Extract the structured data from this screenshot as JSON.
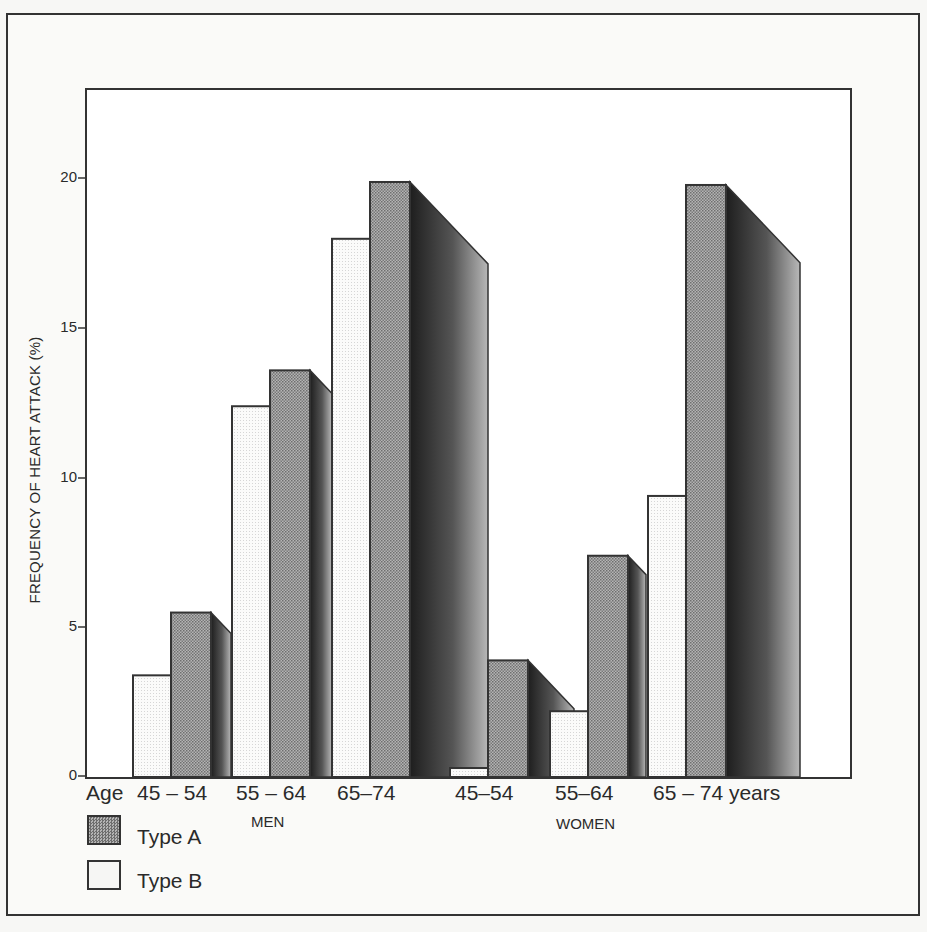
{
  "chart_data": {
    "type": "bar",
    "title": "",
    "xlabel": "Age",
    "ylabel": "FREQUENCY OF HEART ATTACK (%)",
    "ylim": [
      0,
      22
    ],
    "yticks": [
      0,
      5,
      10,
      15,
      20
    ],
    "grid": false,
    "legend_position": "bottom-left",
    "groups": [
      "MEN",
      "WOMEN"
    ],
    "categories": [
      "45 – 54",
      "55 – 64",
      "65–74",
      "45–54",
      "55–64",
      "65 – 74 years"
    ],
    "category_group": [
      "MEN",
      "MEN",
      "MEN",
      "WOMEN",
      "WOMEN",
      "WOMEN"
    ],
    "series": [
      {
        "name": "Type B",
        "values": [
          3.4,
          12.4,
          18.0,
          0.3,
          2.2,
          9.4
        ]
      },
      {
        "name": "Type A",
        "values": [
          5.5,
          13.6,
          19.9,
          3.9,
          7.4,
          19.8
        ]
      }
    ]
  },
  "axis": {
    "ylabel": "FREQUENCY OF HEART ATTACK (%)",
    "xprefix": "Age",
    "ticks": [
      "0",
      "5",
      "10",
      "15",
      "20"
    ]
  },
  "xlabels": [
    "45 – 54",
    "55 – 64",
    "65–74",
    "45–54",
    "55–64",
    "65 – 74 years"
  ],
  "groups": {
    "men": "MEN",
    "women": "WOMEN"
  },
  "legend": {
    "type_a": "Type A",
    "type_b": "Type B"
  },
  "colors": {
    "type_a": "#9a9a9a",
    "type_b": "#f4f4f2",
    "shadow_dark": "#2a2a2a",
    "shadow_light": "#c8c8c8",
    "line": "#333333"
  }
}
